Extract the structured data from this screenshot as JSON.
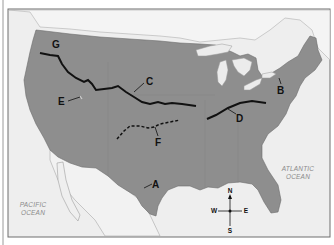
{
  "map": {
    "title": "",
    "colors": {
      "land_highlight": "#8e8e8e",
      "other_land": "#ececec",
      "water": "#f3f3f3",
      "frame": "#777777",
      "lines": "#111111"
    },
    "markers": [
      {
        "id": "A",
        "label": "A",
        "feature": "leader line to Texas Gulf coast"
      },
      {
        "id": "B",
        "label": "B",
        "feature": "leader line to New York / northeast"
      },
      {
        "id": "C",
        "label": "C",
        "feature": "solid line across northern plains"
      },
      {
        "id": "D",
        "label": "D",
        "feature": "solid line across Ohio valley"
      },
      {
        "id": "E",
        "label": "E",
        "feature": "leader line to a point in Idaho/Utah region"
      },
      {
        "id": "F",
        "label": "F",
        "feature": "dashed line across southern plains"
      },
      {
        "id": "G",
        "label": "G",
        "feature": "solid line in the Pacific Northwest"
      }
    ],
    "oceans": {
      "pacific_line1": "PACIFIC",
      "pacific_line2": "OCEAN",
      "atlantic_line1": "ATLANTIC",
      "atlantic_line2": "OCEAN"
    },
    "compass": {
      "n": "N",
      "s": "S",
      "e": "E",
      "w": "W"
    }
  }
}
